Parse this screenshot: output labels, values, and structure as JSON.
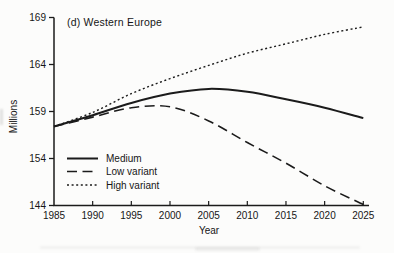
{
  "figure": {
    "title": "(d) Western Europe",
    "y_axis_title": "Millions",
    "x_axis_title": "Year"
  },
  "chart_data": {
    "type": "line",
    "title": "(d) Western Europe",
    "xlabel": "Year",
    "ylabel": "Millions",
    "x": [
      1985,
      1990,
      1995,
      2000,
      2005,
      2010,
      2015,
      2020,
      2025
    ],
    "x_tick_labels": [
      "1985",
      "1990",
      "1995",
      "2000",
      "2005",
      "2010",
      "2015",
      "2020",
      "2025"
    ],
    "xlim": [
      1985,
      2025
    ],
    "y_ticks": [
      169,
      164,
      159,
      154,
      144
    ],
    "y_tick_fractions": [
      0,
      0.25,
      0.5,
      0.75,
      1
    ],
    "grid": false,
    "legend_position": "lower-left",
    "line_color": "#1b1b1b",
    "series": [
      {
        "name": "Medium",
        "dash": "solid",
        "values": [
          157.4,
          158.6,
          159.9,
          160.9,
          161.4,
          161.1,
          160.3,
          159.4,
          158.3
        ]
      },
      {
        "name": "Low variant",
        "dash": "long-dash",
        "values": [
          157.4,
          158.4,
          159.4,
          159.5,
          158.0,
          155.7,
          153.0,
          148.2,
          144.2
        ]
      },
      {
        "name": "High variant",
        "dash": "short-dash",
        "values": [
          157.4,
          158.9,
          160.9,
          162.5,
          163.9,
          165.2,
          166.2,
          167.2,
          168.0
        ]
      }
    ]
  }
}
